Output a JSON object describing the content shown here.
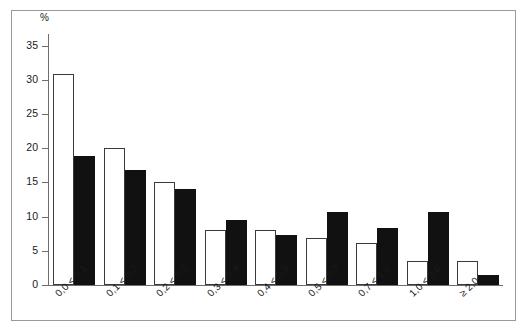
{
  "chart_data": {
    "type": "bar",
    "title": "",
    "subtitle": "",
    "xlabel": "",
    "ylabel": "%",
    "ylim": [
      0,
      35
    ],
    "ytick_labels": [
      "0",
      "5",
      "10",
      "15",
      "20",
      "25",
      "30",
      "35"
    ],
    "ytick_values": [
      0,
      5,
      10,
      15,
      20,
      25,
      30,
      35
    ],
    "grid": false,
    "legend": "none",
    "categories": [
      "0,0 < 0,1",
      "0,1 < 0,2",
      "0,2 < 0,3",
      "0,3 < 0,4",
      "0,4 < 0,5",
      "0,5 < 0,7",
      "0,7 < 1,0",
      "1,0 < 2,0",
      "≥ 2,0"
    ],
    "series": [
      {
        "name": "white-bars",
        "style": "open",
        "color": "#ffffff",
        "edge_color": "#3a3a3a",
        "values": [
          30.9,
          20.0,
          15.0,
          8.0,
          8.0,
          6.9,
          6.1,
          3.5,
          3.5
        ]
      },
      {
        "name": "black-bars",
        "style": "filled",
        "color": "#111111",
        "edge_color": "#111111",
        "values": [
          18.8,
          16.8,
          14.1,
          9.5,
          7.3,
          10.7,
          8.3,
          10.7,
          1.5
        ]
      }
    ]
  },
  "axes": {
    "y_unit": "%",
    "axis_color": "#6e6e6e"
  },
  "frame": {
    "border_color": "#9a9a9a"
  }
}
